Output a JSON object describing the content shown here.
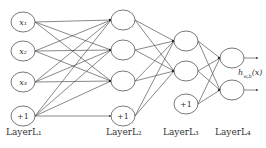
{
  "diagram": {
    "title": "",
    "type": "feedforward neural network",
    "layers": [
      {
        "label": "LayerL₁",
        "nodes": [
          "x₁",
          "x₂",
          "x₃",
          "+1"
        ]
      },
      {
        "label": "LayerL₂",
        "nodes": [
          "",
          "",
          "",
          "+1"
        ]
      },
      {
        "label": "LayerL₃",
        "nodes": [
          "",
          "",
          "+1"
        ]
      },
      {
        "label": "LayerL₄",
        "nodes": [
          "",
          ""
        ]
      }
    ],
    "output_label": "hₒ,ₕ(x)",
    "output_label_display": "h",
    "output_label_sub": "w,b",
    "output_label_arg": "(x)",
    "colors": {
      "stroke": "#555555",
      "text": "#333333",
      "background": "#ffffff"
    }
  }
}
